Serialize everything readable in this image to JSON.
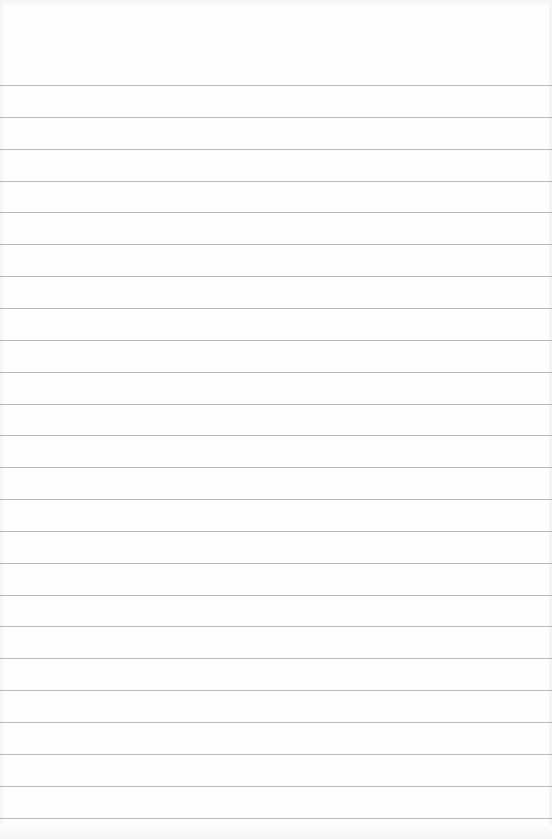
{
  "document": {
    "type": "lined-paper",
    "background_color": "#fefefe",
    "rule_color": "#b9b9b9",
    "rules": {
      "count": 24,
      "first_y": 85,
      "spacing": 31.85
    },
    "text": ""
  }
}
